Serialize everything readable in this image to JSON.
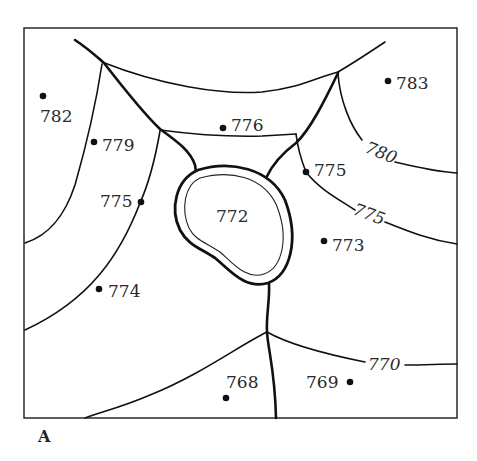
{
  "figure": {
    "panel_label": "A",
    "colors": {
      "ink": "#111111",
      "background": "#ffffff"
    }
  },
  "spot_elevations": [
    {
      "id": "p782",
      "value": "782"
    },
    {
      "id": "p783",
      "value": "783"
    },
    {
      "id": "p779",
      "value": "779"
    },
    {
      "id": "p776",
      "value": "776"
    },
    {
      "id": "p775w",
      "value": "775"
    },
    {
      "id": "p775e",
      "value": "775"
    },
    {
      "id": "p773",
      "value": "773"
    },
    {
      "id": "p774",
      "value": "774"
    },
    {
      "id": "p768",
      "value": "768"
    },
    {
      "id": "p769",
      "value": "769"
    }
  ],
  "lake": {
    "label": "772"
  },
  "contours": [
    {
      "id": "c780",
      "label": "780"
    },
    {
      "id": "c775",
      "label": "775"
    },
    {
      "id": "c770",
      "label": "770"
    }
  ]
}
